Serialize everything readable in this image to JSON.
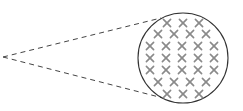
{
  "diagram": {
    "colors": {
      "background": "#ffffff",
      "circle_stroke": "#333333",
      "dash_stroke": "#444444",
      "mark_stroke": "#8a8a8a"
    },
    "apex": {
      "x": 3,
      "y": 57
    },
    "circle": {
      "cx": 183,
      "cy": 58,
      "r": 45
    },
    "rays": [
      {
        "x1": 3,
        "y1": 57,
        "x2": 161,
        "y2": 18
      },
      {
        "x1": 3,
        "y1": 57,
        "x2": 163,
        "y2": 98
      }
    ],
    "mark_rows": [
      {
        "y": 23,
        "xs": [
          167,
          183,
          199
        ]
      },
      {
        "y": 34,
        "xs": [
          158,
          174,
          190,
          206
        ]
      },
      {
        "y": 46,
        "xs": [
          150,
          166,
          182,
          198,
          214
        ]
      },
      {
        "y": 58,
        "xs": [
          150,
          166,
          182,
          198,
          214
        ]
      },
      {
        "y": 70,
        "xs": [
          150,
          166,
          182,
          198,
          214
        ]
      },
      {
        "y": 82,
        "xs": [
          158,
          174,
          190,
          206
        ]
      },
      {
        "y": 94,
        "xs": [
          167,
          183,
          199
        ]
      }
    ],
    "mark_count": 28
  }
}
